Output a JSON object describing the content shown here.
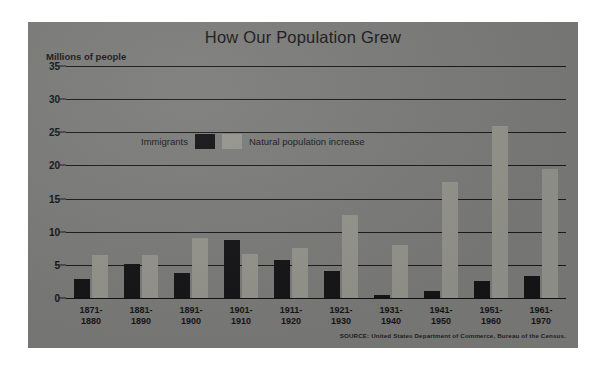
{
  "chart_data": {
    "type": "bar",
    "title": "How Our Population Grew",
    "xlabel": "",
    "ylabel": "Millions of people",
    "ylim": [
      0,
      35
    ],
    "yticks": [
      0,
      5,
      10,
      15,
      20,
      25,
      30,
      35
    ],
    "grid": true,
    "legend_position": "inside-upper-left",
    "categories": [
      "1871-\n1880",
      "1881-\n1890",
      "1891-\n1900",
      "1901-\n1910",
      "1911-\n1920",
      "1921-\n1930",
      "1931-\n1940",
      "1941-\n1950",
      "1951-\n1960",
      "1961-\n1970"
    ],
    "series": [
      {
        "name": "Immigrants",
        "color": "#131316",
        "values": [
          2.8,
          5.2,
          3.7,
          8.8,
          5.7,
          4.1,
          0.5,
          1.0,
          2.5,
          3.3
        ]
      },
      {
        "name": "Natural population increase",
        "color": "#96968f",
        "values": [
          6.5,
          6.5,
          9.0,
          6.7,
          7.5,
          12.5,
          8.0,
          17.5,
          26.0,
          19.5
        ]
      }
    ],
    "annotations": {
      "source": "SOURCE: United States Department of Commerce, Bureau of the Census."
    }
  },
  "panel": {
    "background_color": "#7c7c7a"
  }
}
